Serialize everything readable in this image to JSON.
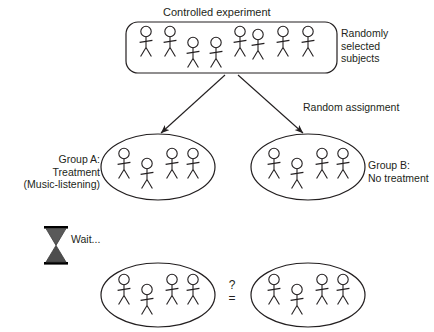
{
  "diagram": {
    "title": "Controlled experiment",
    "labels": {
      "randomly_selected_subjects": "Randomly\nselected\nsubjects",
      "random_assignment": "Random assignment",
      "group_a": "Group A:\nTreatment\n(Music-listening)",
      "group_b": "Group B:\nNo treatment",
      "wait": "Wait...",
      "question_mark": "?",
      "equals": "="
    },
    "icons": {
      "hourglass": "hourglass-icon",
      "arrow_left": "arrow-down-left-icon",
      "arrow_right": "arrow-down-right-icon"
    },
    "colors": {
      "stroke": "#231f20",
      "text": "#231f20",
      "background": "#ffffff",
      "hourglass_fill": "#595959",
      "hourglass_frame": "#000000"
    },
    "groups": {
      "pool": {
        "name": "Randomly selected subjects",
        "subject_count": 8
      },
      "group_a": {
        "name": "Group A: Treatment (Music-listening)",
        "subject_count": 4
      },
      "group_b": {
        "name": "Group B: No treatment",
        "subject_count": 4
      },
      "outcome_a": {
        "name": "Group A outcome",
        "subject_count": 4
      },
      "outcome_b": {
        "name": "Group B outcome",
        "subject_count": 4
      }
    }
  }
}
